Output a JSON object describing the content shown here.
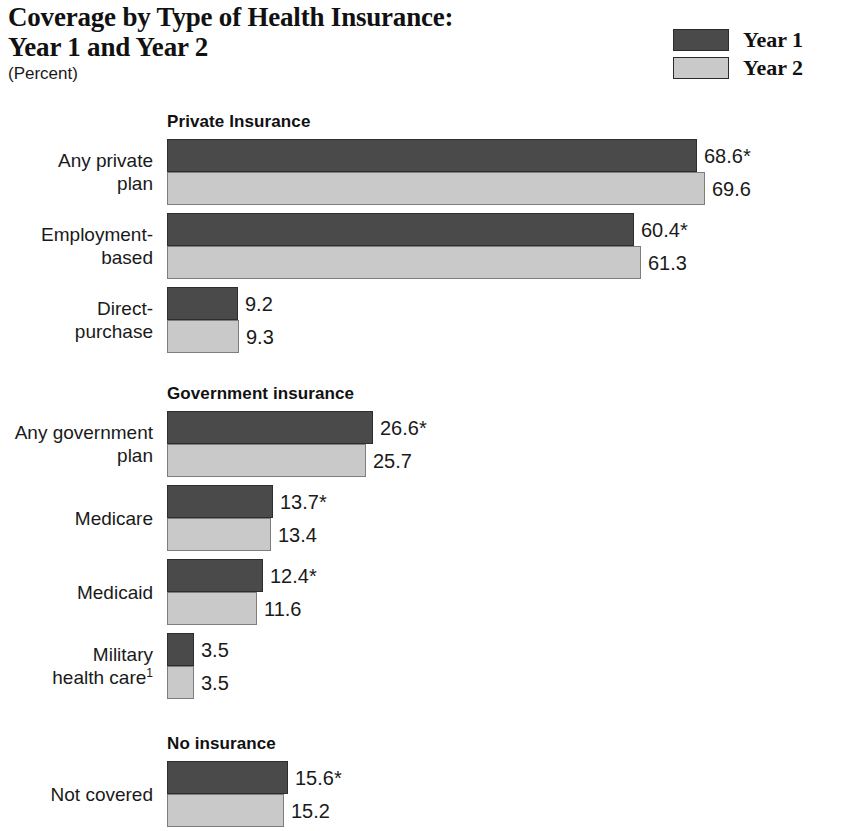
{
  "title": {
    "line1": "Coverage by Type of Health Insurance:",
    "line2": "Year 1 and Year 2",
    "units": "(Percent)"
  },
  "legend": {
    "items": [
      {
        "label": "Year 1",
        "color": "#4a4a4a"
      },
      {
        "label": "Year 2",
        "color": "#c9c9c9"
      }
    ]
  },
  "chart_data": {
    "type": "bar",
    "orientation": "horizontal",
    "title": "Coverage by Type of Health Insurance: Year 1 and Year 2",
    "subtitle": "(Percent)",
    "xlabel": "Percent",
    "ylabel": "",
    "xlim": [
      0,
      70
    ],
    "grid": false,
    "legend_position": "top-right",
    "series": [
      {
        "name": "Year 1",
        "color": "#4a4a4a"
      },
      {
        "name": "Year 2",
        "color": "#c9c9c9"
      }
    ],
    "panels": [
      {
        "title": "Private Insurance",
        "categories": [
          "Any private plan",
          "Employment-based",
          "Direct-purchase"
        ],
        "rows": [
          {
            "category_line1": "Any private",
            "category_line2": "plan",
            "values": [
              68.6,
              69.6
            ],
            "labels": [
              "68.6*",
              "69.6"
            ]
          },
          {
            "category_line1": "Employment-",
            "category_line2": "based",
            "values": [
              60.4,
              61.3
            ],
            "labels": [
              "60.4*",
              "61.3"
            ]
          },
          {
            "category_line1": "Direct-",
            "category_line2": "purchase",
            "values": [
              9.2,
              9.3
            ],
            "labels": [
              "9.2",
              "9.3"
            ]
          }
        ]
      },
      {
        "title": "Government insurance",
        "categories": [
          "Any government plan",
          "Medicare",
          "Medicaid",
          "Military health care"
        ],
        "rows": [
          {
            "category_line1": "Any government",
            "category_line2": "plan",
            "values": [
              26.6,
              25.7
            ],
            "labels": [
              "26.6*",
              "25.7"
            ]
          },
          {
            "category_line1": "Medicare",
            "category_line2": "",
            "values": [
              13.7,
              13.4
            ],
            "labels": [
              "13.7*",
              "13.4"
            ]
          },
          {
            "category_line1": "Medicaid",
            "category_line2": "",
            "values": [
              12.4,
              11.6
            ],
            "labels": [
              "12.4*",
              "11.6"
            ]
          },
          {
            "category_line1": "Military",
            "category_line2": "health care",
            "category_line2_sup": "1",
            "values": [
              3.5,
              3.5
            ],
            "labels": [
              "3.5",
              "3.5"
            ]
          }
        ]
      },
      {
        "title": "No insurance",
        "categories": [
          "Not covered"
        ],
        "rows": [
          {
            "category_line1": "Not covered",
            "category_line2": "",
            "values": [
              15.6,
              15.2
            ],
            "labels": [
              "15.6*",
              "15.2"
            ]
          }
        ]
      }
    ]
  }
}
